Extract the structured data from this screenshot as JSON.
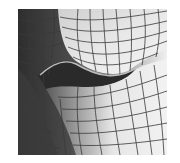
{
  "image": {
    "subject": "3D polygon wireframe mesh of a mouth / lip region",
    "background_color": "#ffffff",
    "mesh_line_color": "#3a3a3a",
    "shades": {
      "darkest": "#2e2e2e",
      "dark": "#4a4a4a",
      "mid_dark": "#6e6e6e",
      "mid": "#9a9a9a",
      "light": "#cfcfcf",
      "lightest": "#f0f0f0"
    }
  }
}
